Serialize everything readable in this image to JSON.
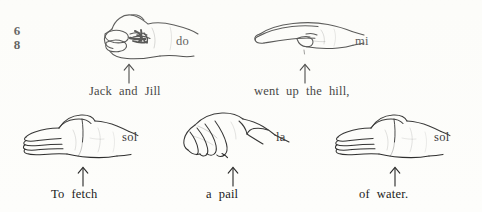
{
  "figure": {
    "background_color": "#fdfdfb",
    "ink_color": "#1a1a1a"
  },
  "time_signature": {
    "upper": "6",
    "lower": "8"
  },
  "signs": [
    {
      "id": "sign-do",
      "syllable": "do",
      "hand_shape": "closed-fist",
      "lyric_words": [
        "Jack",
        "and",
        "Jill"
      ],
      "lyric_text": "Jack and Jill",
      "arrow": "up-arrow"
    },
    {
      "id": "sign-mi",
      "syllable": "mi",
      "hand_shape": "flat-horizontal-hand",
      "lyric_words": [
        "went",
        "up",
        "the",
        "hill,"
      ],
      "lyric_text": "went up the hill,",
      "arrow": "up-arrow"
    },
    {
      "id": "sign-sol-1",
      "syllable": "sol",
      "hand_shape": "open-palm-vertical",
      "lyric_words": [
        "To",
        "fetch"
      ],
      "lyric_text": "To fetch",
      "arrow": "up-arrow"
    },
    {
      "id": "sign-la",
      "syllable": "la",
      "hand_shape": "drooping-hand",
      "lyric_words": [
        "a",
        "pail"
      ],
      "lyric_text": "a pail",
      "arrow": "up-arrow"
    },
    {
      "id": "sign-sol-2",
      "syllable": "sol",
      "hand_shape": "open-palm-vertical",
      "lyric_words": [
        "of",
        "water."
      ],
      "lyric_text": "of water.",
      "arrow": "up-arrow"
    }
  ]
}
